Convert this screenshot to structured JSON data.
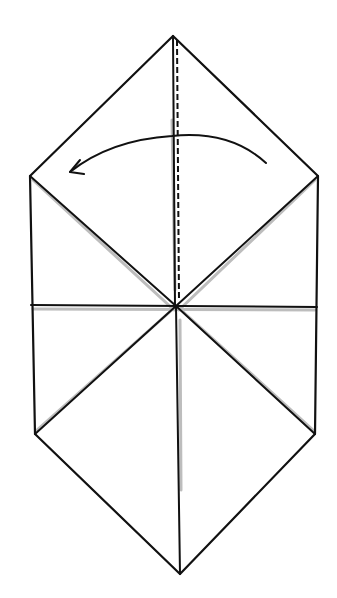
{
  "diagram": {
    "type": "origami-fold-step",
    "background": "#ffffff",
    "line_color": "#111111",
    "shadow_color": "#bdbdbd",
    "shape": "elongated hexagon (folded paper outline)",
    "vertices": {
      "top_apex": [
        173,
        36
      ],
      "upper_left": [
        30,
        176
      ],
      "upper_right": [
        318,
        176
      ],
      "center": [
        176,
        306
      ],
      "lower_left": [
        35,
        434
      ],
      "lower_right": [
        315,
        434
      ],
      "bottom_apex": [
        180,
        574
      ]
    },
    "creases": [
      {
        "name": "horizontal-crease",
        "from": [
          31,
          305
        ],
        "to": [
          317,
          307
        ]
      },
      {
        "name": "upper-left-diagonal",
        "from": [
          30,
          176
        ],
        "to": [
          176,
          306
        ]
      },
      {
        "name": "upper-right-diagonal",
        "from": [
          318,
          176
        ],
        "to": [
          176,
          306
        ]
      },
      {
        "name": "lower-left-diagonal",
        "from": [
          35,
          434
        ],
        "to": [
          176,
          306
        ]
      },
      {
        "name": "lower-right-diagonal",
        "from": [
          315,
          434
        ],
        "to": [
          176,
          306
        ]
      },
      {
        "name": "lower-vertical",
        "from": [
          176,
          306
        ],
        "to": [
          180,
          574
        ]
      }
    ],
    "valley_fold_line": {
      "from": [
        173,
        36
      ],
      "to": [
        176,
        306
      ],
      "style": "dashed"
    },
    "fold_arrow": {
      "direction": "right-to-left",
      "start": [
        266,
        162
      ],
      "apex": [
        172,
        136
      ],
      "end": [
        70,
        172
      ]
    }
  }
}
